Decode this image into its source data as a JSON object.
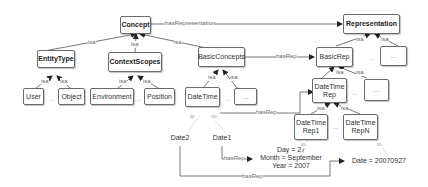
{
  "diagram": {
    "nodes": {
      "concept": "Concept",
      "representation": "Representation",
      "entity_type": "EntityType",
      "context_scopes": "ContextScopes",
      "basic_concepts": "BasicConcepts",
      "basic_rep": "BasicRep",
      "rep_other": "...",
      "user": "User",
      "object": "Object",
      "environment": "Environment",
      "position": "Position",
      "date_time": "DateTime",
      "bc_other": "...",
      "date_time_rep": "DateTime\nRep",
      "br_other": "...",
      "date_time_rep1": "DateTime\nRep1",
      "date_time_repn": "DateTime\nRepN"
    },
    "instances": {
      "date1": "Date1",
      "date2": "Date2",
      "value_components": "Day = 27\nMonth = September\nYear = 2007",
      "value_compact": "Date = 20070927"
    },
    "edge_labels": {
      "has_representation": "hasRepresentation",
      "has_rep": "hasRep",
      "isa": "isa",
      "io": "io",
      "ellipsis": "..."
    }
  }
}
